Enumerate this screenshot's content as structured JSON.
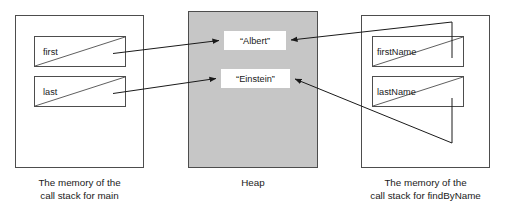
{
  "diagram": {
    "colors": {
      "heap_fill": "#c6c6c6",
      "panel_stroke": "#4d4d4d",
      "box_stroke": "#4d4d4d",
      "arrow_stroke": "#1a1a1a",
      "string_box_fill": "#ffffff",
      "text": "#1a1a1a",
      "page_background": "#ffffff"
    },
    "panels": {
      "main_stack": {
        "caption_line1": "The memory of the",
        "caption_line2": "call stack for main",
        "variables": [
          {
            "name": "first"
          },
          {
            "name": "last"
          }
        ]
      },
      "heap": {
        "caption": "Heap",
        "strings": [
          {
            "value": "“Albert”"
          },
          {
            "value": "“Einstein”"
          }
        ]
      },
      "findbyname_stack": {
        "caption_line1": "The memory of the",
        "caption_line2": "call stack for findByName",
        "variables": [
          {
            "name": "firstName"
          },
          {
            "name": "lastName"
          }
        ]
      }
    },
    "references": [
      {
        "from": "first",
        "to": "“Albert”"
      },
      {
        "from": "last",
        "to": "“Einstein”"
      },
      {
        "from": "firstName",
        "to": "“Albert”"
      },
      {
        "from": "lastName",
        "to": "“Einstein”"
      }
    ]
  }
}
